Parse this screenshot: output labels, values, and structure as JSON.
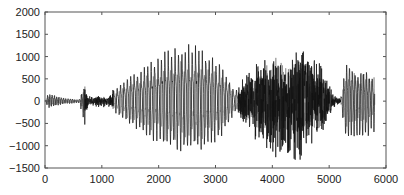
{
  "chart_data": {
    "type": "line",
    "title": "",
    "xlabel": "",
    "ylabel": "",
    "xlim": [
      0,
      6000
    ],
    "ylim": [
      -1500,
      2000
    ],
    "xticks": [
      0,
      1000,
      2000,
      3000,
      4000,
      5000,
      6000
    ],
    "yticks": [
      2000,
      1500,
      1000,
      500,
      0,
      -500,
      -1000,
      -1500
    ],
    "xtick_labels": [
      "0",
      "1000",
      "2000",
      "3000",
      "4000",
      "5000",
      "6000"
    ],
    "ytick_labels": [
      "2000",
      "1500",
      "1000",
      "500",
      "0",
      "−500",
      "−1000",
      "−1500"
    ],
    "grid": false,
    "legend": null,
    "series": [
      {
        "name": "waveform",
        "description": "Speech-like audio waveform (amplitude vs sample index)",
        "envelope": [
          {
            "x": 0,
            "max": 0,
            "min": 0
          },
          {
            "x": 50,
            "max": 220,
            "min": -150
          },
          {
            "x": 150,
            "max": 200,
            "min": -120
          },
          {
            "x": 350,
            "max": 100,
            "min": -60
          },
          {
            "x": 600,
            "max": 40,
            "min": -40
          },
          {
            "x": 700,
            "max": 450,
            "min": -600
          },
          {
            "x": 760,
            "max": 120,
            "min": -120
          },
          {
            "x": 1100,
            "max": 120,
            "min": -150
          },
          {
            "x": 1250,
            "max": 400,
            "min": -300
          },
          {
            "x": 1500,
            "max": 800,
            "min": -500
          },
          {
            "x": 1800,
            "max": 1100,
            "min": -800
          },
          {
            "x": 2100,
            "max": 1450,
            "min": -1000
          },
          {
            "x": 2500,
            "max": 1750,
            "min": -1150
          },
          {
            "x": 2800,
            "max": 1550,
            "min": -1050
          },
          {
            "x": 3100,
            "max": 1100,
            "min": -800
          },
          {
            "x": 3350,
            "max": 300,
            "min": -250
          },
          {
            "x": 3500,
            "max": 600,
            "min": -600
          },
          {
            "x": 3800,
            "max": 1050,
            "min": -1100
          },
          {
            "x": 4200,
            "max": 1000,
            "min": -1450
          },
          {
            "x": 4500,
            "max": 1450,
            "min": -1500
          },
          {
            "x": 4800,
            "max": 1000,
            "min": -1000
          },
          {
            "x": 5100,
            "max": 150,
            "min": -150
          },
          {
            "x": 5200,
            "max": 50,
            "min": -50
          },
          {
            "x": 5300,
            "max": 1250,
            "min": -1000
          },
          {
            "x": 5500,
            "max": 950,
            "min": -900
          },
          {
            "x": 5800,
            "max": 800,
            "min": -700
          }
        ],
        "segments": [
          {
            "start": 0,
            "end": 700,
            "kind": "periodic",
            "period": 40
          },
          {
            "start": 700,
            "end": 1200,
            "kind": "noise",
            "period": 12
          },
          {
            "start": 1200,
            "end": 3400,
            "kind": "periodic",
            "period": 60
          },
          {
            "start": 3400,
            "end": 5200,
            "kind": "noise",
            "period": 10
          },
          {
            "start": 5200,
            "end": 5800,
            "kind": "periodic",
            "period": 50
          }
        ]
      }
    ]
  },
  "plot_area": {
    "left": 45,
    "right": 386,
    "top": 12,
    "bottom": 168
  }
}
